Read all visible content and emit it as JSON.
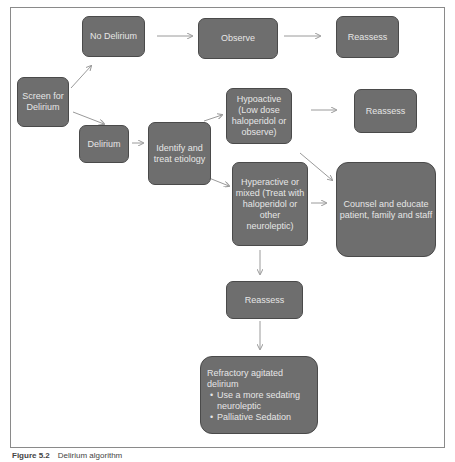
{
  "nodes": {
    "screen": "Screen for Delirium",
    "no_delirium": "No Delirium",
    "observe": "Observe",
    "reassess_top": "Reassess",
    "delirium": "Delirium",
    "identify": "Identify and treat etiology",
    "hypoactive": "Hypoactive (Low dose haloperidol or observe)",
    "reassess_hypo": "Reassess",
    "hyperactive": "Hyperactive or mixed (Treat with haloperidol or other neuroleptic)",
    "counsel": "Counsel and educate patient, family and staff",
    "reassess_hyper": "Reassess",
    "refractory": {
      "title": "Refractory agitated delirium",
      "bullets": [
        "Use a more sedating neuroleptic",
        "Palliative Sedation"
      ]
    }
  },
  "caption": {
    "label": "Figure 5.2",
    "text": "Delirium algorithm"
  },
  "colors": {
    "node_fill": "#6e6e6e",
    "node_text": "#e6e6e6",
    "arrow": "#9a9a9a"
  }
}
